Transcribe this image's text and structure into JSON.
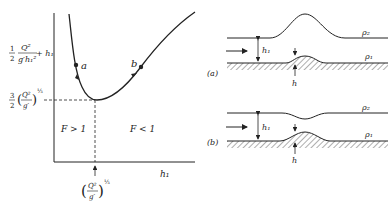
{
  "graph": {
    "y_label_main": {
      "half": "1",
      "half_den": "2",
      "frac_num": "Q²",
      "frac_den": "g′h₁²",
      "plus_term": "+ h₁"
    },
    "y_label_min": {
      "coef_num": "3",
      "coef_den": "2",
      "paren_num": "Q²",
      "paren_den": "g′",
      "exponent": "⅓"
    },
    "x_label": "h₁",
    "x_critical": {
      "paren_num": "Q²",
      "paren_den": "g′",
      "exponent": "⅓"
    },
    "region_left": "F > 1",
    "region_right": "F < 1",
    "point_a": "a",
    "point_b": "b"
  },
  "panel_a": {
    "label": "(a)",
    "depth_label": "h₁",
    "bump_label": "h",
    "upper_density": "ρ₂",
    "lower_density": "ρ₁"
  },
  "panel_b": {
    "label": "(b)",
    "depth_label": "h₁",
    "bump_label": "h",
    "upper_density": "ρ₂",
    "lower_density": "ρ₁"
  }
}
